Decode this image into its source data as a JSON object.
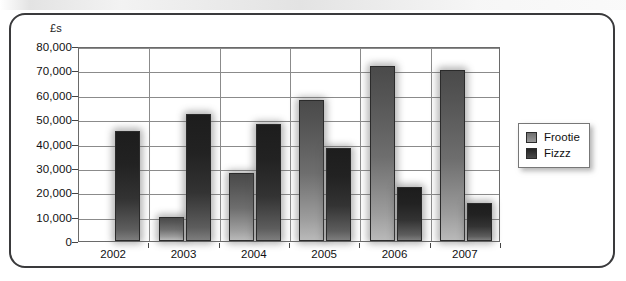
{
  "figure": {
    "y_unit_label": "£s"
  },
  "legend": {
    "position": "right",
    "items": [
      {
        "label": "Frootie",
        "swatch": "light-grey-swatch-icon"
      },
      {
        "label": "Fizzz",
        "swatch": "dark-grey-swatch-icon"
      }
    ]
  },
  "chart_data": {
    "type": "bar",
    "title": "",
    "xlabel": "",
    "ylabel": "£s",
    "ylim": [
      0,
      80000
    ],
    "ytick_labels": [
      "0",
      "10,000",
      "20,000",
      "30,000",
      "40,000",
      "50,000",
      "60,000",
      "70,000",
      "80,000"
    ],
    "ytick_values": [
      0,
      10000,
      20000,
      30000,
      40000,
      50000,
      60000,
      70000,
      80000
    ],
    "grid": true,
    "categories": [
      "2002",
      "2003",
      "2004",
      "2005",
      "2006",
      "2007"
    ],
    "series": [
      {
        "name": "Frootie",
        "color": "#7a7a7a",
        "values": [
          0,
          10000,
          28000,
          58000,
          72000,
          70000
        ]
      },
      {
        "name": "Fizzz",
        "color": "#2b2b2b",
        "values": [
          45000,
          52000,
          48000,
          38000,
          22000,
          15500
        ]
      }
    ]
  }
}
